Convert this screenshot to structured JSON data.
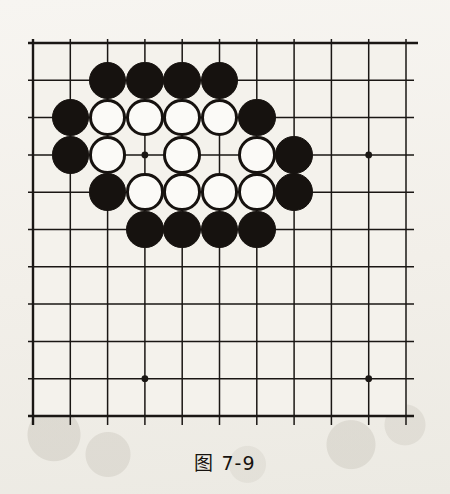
{
  "figure": {
    "caption": "图 7-9",
    "board": {
      "columns": 11,
      "rows": 11,
      "line_color": "#1a1714",
      "board_color": "#f4f2ec",
      "star_points": [
        {
          "col": 3,
          "row": 3
        },
        {
          "col": 9,
          "row": 3
        },
        {
          "col": 3,
          "row": 9
        },
        {
          "col": 9,
          "row": 9
        }
      ],
      "stones": [
        {
          "col": 2,
          "row": 1,
          "color": "black"
        },
        {
          "col": 3,
          "row": 1,
          "color": "black"
        },
        {
          "col": 4,
          "row": 1,
          "color": "black"
        },
        {
          "col": 5,
          "row": 1,
          "color": "black"
        },
        {
          "col": 1,
          "row": 2,
          "color": "black"
        },
        {
          "col": 2,
          "row": 2,
          "color": "white"
        },
        {
          "col": 3,
          "row": 2,
          "color": "white"
        },
        {
          "col": 4,
          "row": 2,
          "color": "white"
        },
        {
          "col": 5,
          "row": 2,
          "color": "white"
        },
        {
          "col": 6,
          "row": 2,
          "color": "black"
        },
        {
          "col": 1,
          "row": 3,
          "color": "black"
        },
        {
          "col": 2,
          "row": 3,
          "color": "white"
        },
        {
          "col": 4,
          "row": 3,
          "color": "white"
        },
        {
          "col": 6,
          "row": 3,
          "color": "white"
        },
        {
          "col": 7,
          "row": 3,
          "color": "black"
        },
        {
          "col": 2,
          "row": 4,
          "color": "black"
        },
        {
          "col": 3,
          "row": 4,
          "color": "white"
        },
        {
          "col": 4,
          "row": 4,
          "color": "white"
        },
        {
          "col": 5,
          "row": 4,
          "color": "white"
        },
        {
          "col": 6,
          "row": 4,
          "color": "white"
        },
        {
          "col": 7,
          "row": 4,
          "color": "black"
        },
        {
          "col": 3,
          "row": 5,
          "color": "black"
        },
        {
          "col": 4,
          "row": 5,
          "color": "black"
        },
        {
          "col": 5,
          "row": 5,
          "color": "black"
        },
        {
          "col": 6,
          "row": 5,
          "color": "black"
        }
      ]
    }
  },
  "chart_data": {
    "type": "diagram",
    "title": "图 7-9",
    "subtype": "go-board-position",
    "grid": {
      "cols": 11,
      "rows": 11,
      "spacing_px": 37.5,
      "origin_px": [
        33,
        43
      ]
    },
    "star_points": [
      [
        3,
        3
      ],
      [
        9,
        3
      ],
      [
        3,
        9
      ],
      [
        9,
        9
      ]
    ],
    "black_stones": [
      [
        2,
        1
      ],
      [
        3,
        1
      ],
      [
        4,
        1
      ],
      [
        5,
        1
      ],
      [
        1,
        2
      ],
      [
        6,
        2
      ],
      [
        1,
        3
      ],
      [
        7,
        3
      ],
      [
        2,
        4
      ],
      [
        7,
        4
      ],
      [
        3,
        5
      ],
      [
        4,
        5
      ],
      [
        5,
        5
      ],
      [
        6,
        5
      ]
    ],
    "white_stones": [
      [
        2,
        2
      ],
      [
        3,
        2
      ],
      [
        4,
        2
      ],
      [
        5,
        2
      ],
      [
        2,
        3
      ],
      [
        4,
        3
      ],
      [
        6,
        3
      ],
      [
        3,
        4
      ],
      [
        4,
        4
      ],
      [
        5,
        4
      ],
      [
        6,
        4
      ]
    ],
    "empty_marked_points": [
      [
        3,
        3
      ],
      [
        5,
        3
      ]
    ],
    "counts": {
      "black": 14,
      "white": 11,
      "total": 25
    }
  }
}
